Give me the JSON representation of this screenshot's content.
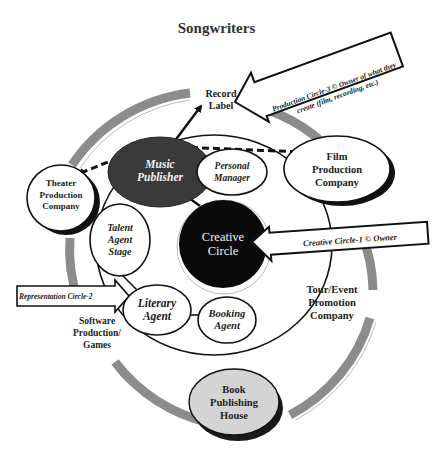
{
  "title": "Songwriters",
  "nodes": {
    "record_label": {
      "line1": "Record",
      "line2": "Label"
    },
    "music_publisher": {
      "line1": "Music",
      "line2": "Publisher"
    },
    "personal_manager": {
      "line1": "Personal",
      "line2": "Manager"
    },
    "film_production": {
      "line1": "Film",
      "line2": "Production",
      "line3": "Company"
    },
    "theater_production": {
      "line1": "Theater",
      "line2": "Production",
      "line3": "Company"
    },
    "creative_circle": {
      "line1": "Creative",
      "line2": "Circle"
    },
    "talent_agent": {
      "line1": "Talent",
      "line2": "Agent",
      "line3": "Stage"
    },
    "literary_agent": {
      "line1": "Literary",
      "line2": "Agent"
    },
    "booking_agent": {
      "line1": "Booking",
      "line2": "Agent"
    },
    "tour_event": {
      "line1": "Tour/Event",
      "line2": "Promotion",
      "line3": "Company"
    },
    "software": {
      "line1": "Software",
      "line2": "Production/",
      "line3": "Games"
    },
    "book_publishing": {
      "line1": "Book",
      "line2": "Publishing",
      "line3": "House"
    }
  },
  "callouts": {
    "production": {
      "line1": "Production Circle-3 © Owner of what they",
      "line2": "create (film, recording, etc.)"
    },
    "creative": {
      "text": "Creative Circle-1  © Owner"
    },
    "representation": {
      "text": "Representation Circle-2"
    }
  },
  "colors": {
    "outer_ring": "#8c8c8c",
    "music_publisher_fill": "#3a3a3a",
    "creative_circle_fill": "#0a0a0a",
    "book_publishing_fill": "#d4d4d4",
    "stroke": "#111111"
  }
}
